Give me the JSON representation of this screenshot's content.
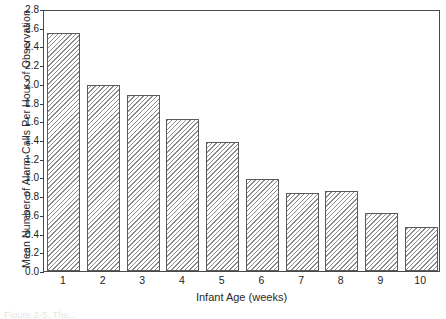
{
  "figure": {
    "caption_remnant": "Figure 2-5. The..."
  },
  "chart_data": {
    "type": "bar",
    "title": "",
    "xlabel": "Infant Age (weeks)",
    "ylabel": "Mean Number of Alarm Calls Per Hour of Observation",
    "categories": [
      "1",
      "2",
      "3",
      "4",
      "5",
      "6",
      "7",
      "8",
      "9",
      "10"
    ],
    "values": [
      2.54,
      1.99,
      1.88,
      1.62,
      1.38,
      0.98,
      0.83,
      0.85,
      0.62,
      0.47
    ],
    "ylim": [
      0.0,
      2.8
    ],
    "ytick_labels": [
      "0.0",
      "0.2",
      "0.4",
      "0.6",
      "0.8",
      "1.0",
      "1.2",
      "1.4",
      "1.6",
      "1.8",
      "2.0",
      "2.2",
      "2.4",
      "2.6",
      "2.8"
    ],
    "ytick_values": [
      0.0,
      0.2,
      0.4,
      0.6,
      0.8,
      1.0,
      1.2,
      1.4,
      1.6,
      1.8,
      2.0,
      2.2,
      2.4,
      2.6,
      2.8
    ],
    "grid": false,
    "legend": null,
    "bar_fill": "hatched-diagonal",
    "bar_edge_color": "#5a5a5a",
    "frame_color": "#4a4a4a"
  }
}
